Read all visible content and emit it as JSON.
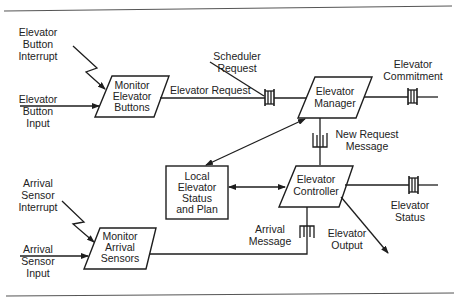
{
  "diagram": {
    "type": "concurrent task architecture diagram",
    "colors": {
      "line": "#1e1e1e",
      "text": "#222222",
      "background": "#ffffff",
      "rule": "#555555"
    },
    "tasks": {
      "monitor_buttons": {
        "lines": [
          "Monitor",
          "Elevator",
          "Buttons"
        ],
        "shape": "parallelogram"
      },
      "elevator_manager": {
        "lines": [
          "Elevator",
          "Manager"
        ],
        "shape": "parallelogram"
      },
      "elevator_controller": {
        "lines": [
          "Elevator",
          "Controller"
        ],
        "shape": "parallelogram"
      },
      "monitor_sensors": {
        "lines": [
          "Monitor",
          "Arrival",
          "Sensors"
        ],
        "shape": "parallelogram"
      }
    },
    "data_store": {
      "local_status": {
        "lines": [
          "Local",
          "Elevator",
          "Status",
          "and Plan"
        ],
        "shape": "rectangle"
      }
    },
    "labels": {
      "button_interrupt": [
        "Elevator",
        "Button",
        "Interrupt"
      ],
      "button_input": [
        "Elevator",
        "Button",
        "Input"
      ],
      "elevator_request": "Elevator Request",
      "scheduler_request": [
        "Scheduler",
        "Request"
      ],
      "elevator_commitment": [
        "Elevator",
        "Commitment"
      ],
      "new_request_message": [
        "New Request",
        "Message"
      ],
      "elevator_status": [
        "Elevator",
        "Status"
      ],
      "elevator_output": [
        "Elevator",
        "Output"
      ],
      "arrival_message": [
        "Arrival",
        "Message"
      ],
      "sensor_interrupt": [
        "Arrival",
        "Sensor",
        "Interrupt"
      ],
      "sensor_input": [
        "Arrival",
        "Sensor",
        "Input"
      ]
    },
    "message_queues": [
      "Elevator Request",
      "Elevator Commitment",
      "New Request Message",
      "Elevator Status",
      "Arrival Message"
    ]
  }
}
